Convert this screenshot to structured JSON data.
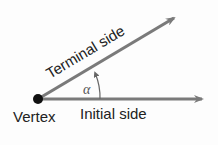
{
  "diagram": {
    "labels": {
      "terminal_side": "Terminal side",
      "initial_side": "Initial side",
      "vertex": "Vertex",
      "angle": "α"
    },
    "colors": {
      "ray": "#7a7a7a",
      "vertex_dot": "#111111",
      "text": "#222222",
      "angle_label": "#555555",
      "background": "#fdfdfd"
    }
  }
}
